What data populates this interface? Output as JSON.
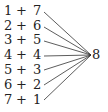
{
  "diagram": {
    "pairs": [
      {
        "a": "1",
        "op": "+",
        "b": "7"
      },
      {
        "a": "2",
        "op": "+",
        "b": "6"
      },
      {
        "a": "3",
        "op": "+",
        "b": "5"
      },
      {
        "a": "4",
        "op": "+",
        "b": "4"
      },
      {
        "a": "5",
        "op": "+",
        "b": "3"
      },
      {
        "a": "6",
        "op": "+",
        "b": "2"
      },
      {
        "a": "7",
        "op": "+",
        "b": "1"
      }
    ],
    "target": "8",
    "line_color": "#333333"
  }
}
